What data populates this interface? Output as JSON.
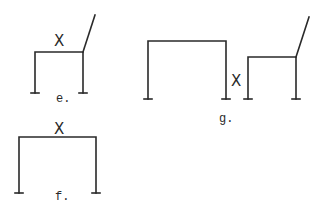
{
  "figures": [
    {
      "id": "e",
      "label": "e.",
      "description": "chair frame with backrest",
      "marker": "X"
    },
    {
      "id": "f",
      "label": "f.",
      "description": "wide table frame",
      "marker": "X"
    },
    {
      "id": "g",
      "label": "g.",
      "description": "table frame beside chair frame",
      "marker": "X"
    }
  ],
  "colors": {
    "stroke": "#2a2a2a",
    "background": "#ffffff"
  }
}
